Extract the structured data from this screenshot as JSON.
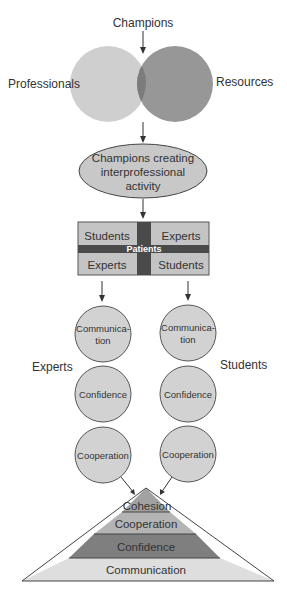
{
  "diagram": {
    "top_label": "Champions",
    "venn": {
      "left_label": "Professionals",
      "right_label": "Resources"
    },
    "ellipse": {
      "lines": [
        "Champions creating",
        "interprofessional",
        "activity"
      ]
    },
    "grid": {
      "top_left": "Students",
      "top_right": "Experts",
      "center": "Patients",
      "bottom_left": "Experts",
      "bottom_right": "Students"
    },
    "left_column": {
      "label": "Experts",
      "circles": [
        {
          "lines": [
            "Communica-",
            "tion"
          ]
        },
        {
          "lines": [
            "Confidence"
          ]
        },
        {
          "lines": [
            "Cooperation"
          ]
        }
      ]
    },
    "right_column": {
      "label": "Students",
      "circles": [
        {
          "lines": [
            "Communica-",
            "tion"
          ]
        },
        {
          "lines": [
            "Confidence"
          ]
        },
        {
          "lines": [
            "Cooperation"
          ]
        }
      ]
    },
    "pyramid": {
      "levels": [
        "Cohesion",
        "Cooperation",
        "Confidence",
        "Communication"
      ]
    },
    "colors": {
      "light_gray": "#d0d0d0",
      "mid_gray": "#a8a8a8",
      "dark_gray": "#6a6a6a",
      "bar_dark": "#4a4a4a",
      "pyramid_top": "#9e9e9e",
      "pyramid_coop": "#b0b0b0",
      "pyramid_conf": "#7d7d7d",
      "pyramid_comm": "#dcdcdc"
    }
  }
}
